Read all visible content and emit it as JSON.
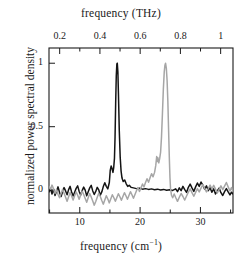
{
  "chart_data": {
    "type": "line",
    "title": "",
    "xlabel": "frequency (cm−1)",
    "xlabel_top": "frequency (THz)",
    "ylabel": "normalized power spectral density",
    "xlim": [
      4.9,
      35.4
    ],
    "ylim": [
      -0.18,
      1.12
    ],
    "xlim_top": [
      0.1469,
      1.0614
    ],
    "grid": false,
    "legend": false,
    "axes": {
      "bottom": {
        "label": "frequency (cm−1)",
        "unit": "cm^-1",
        "major_ticks": [
          10,
          20,
          30
        ],
        "minor_ticks": [
          5,
          15,
          25,
          35
        ],
        "tick_labels": [
          "10",
          "20",
          "30"
        ]
      },
      "top": {
        "label": "frequency (THz)",
        "unit": "THz",
        "major_ticks": [
          0.2,
          0.4,
          0.6,
          0.8,
          1.0
        ],
        "minor_ticks": [
          0.3,
          0.5,
          0.7,
          0.9
        ],
        "tick_labels": [
          "0.2",
          "0.4",
          "0.6",
          "0.8",
          "1"
        ]
      },
      "left": {
        "label": "normalized power spectral density",
        "major_ticks": [
          0,
          0.5,
          1
        ],
        "tick_labels": [
          "0",
          "0.5",
          "1"
        ]
      }
    },
    "series": [
      {
        "name": "black-trace",
        "color": "#141414",
        "peak_x": 16.2,
        "peak_y": 1.0,
        "points": [
          [
            4.9,
            -0.015
          ],
          [
            5.15,
            0.012
          ],
          [
            5.4,
            -0.03
          ],
          [
            5.65,
            0.008
          ],
          [
            5.9,
            -0.042
          ],
          [
            6.15,
            -0.008
          ],
          [
            6.4,
            0.026
          ],
          [
            6.65,
            -0.018
          ],
          [
            6.9,
            -0.05
          ],
          [
            7.15,
            -0.012
          ],
          [
            7.4,
            0.02
          ],
          [
            7.65,
            -0.006
          ],
          [
            7.9,
            -0.036
          ],
          [
            8.15,
            0.004
          ],
          [
            8.4,
            0.03
          ],
          [
            8.65,
            -0.014
          ],
          [
            8.9,
            -0.046
          ],
          [
            9.15,
            -0.016
          ],
          [
            9.4,
            0.014
          ],
          [
            9.65,
            0.034
          ],
          [
            9.9,
            -0.01
          ],
          [
            10.15,
            -0.038
          ],
          [
            10.4,
            -0.004
          ],
          [
            10.65,
            0.024
          ],
          [
            10.9,
            0.0
          ],
          [
            11.15,
            -0.044
          ],
          [
            11.4,
            -0.012
          ],
          [
            11.65,
            0.018
          ],
          [
            11.9,
            0.038
          ],
          [
            12.15,
            -0.006
          ],
          [
            12.4,
            -0.034
          ],
          [
            12.65,
            -0.01
          ],
          [
            12.9,
            0.022
          ],
          [
            13.15,
            0.002
          ],
          [
            13.4,
            -0.04
          ],
          [
            13.65,
            -0.014
          ],
          [
            13.9,
            0.028
          ],
          [
            14.15,
            0.058
          ],
          [
            14.4,
            0.03
          ],
          [
            14.65,
            0.01
          ],
          [
            14.9,
            0.06
          ],
          [
            15.05,
            0.155
          ],
          [
            15.2,
            0.19
          ],
          [
            15.35,
            0.17
          ],
          [
            15.5,
            0.14
          ],
          [
            15.62,
            0.175
          ],
          [
            15.75,
            0.25
          ],
          [
            15.85,
            0.42
          ],
          [
            15.95,
            0.68
          ],
          [
            16.05,
            0.9
          ],
          [
            16.15,
            0.995
          ],
          [
            16.22,
            1.0
          ],
          [
            16.32,
            0.93
          ],
          [
            16.42,
            0.74
          ],
          [
            16.55,
            0.47
          ],
          [
            16.7,
            0.26
          ],
          [
            16.85,
            0.15
          ],
          [
            17.0,
            0.095
          ],
          [
            17.2,
            0.068
          ],
          [
            17.45,
            0.08
          ],
          [
            17.7,
            0.05
          ],
          [
            17.95,
            0.03
          ],
          [
            18.2,
            0.038
          ],
          [
            18.5,
            0.022
          ],
          [
            18.9,
            0.018
          ],
          [
            19.4,
            0.012
          ],
          [
            19.9,
            0.016
          ],
          [
            20.4,
            0.008
          ],
          [
            20.9,
            0.012
          ],
          [
            21.4,
            0.006
          ],
          [
            21.9,
            0.01
          ],
          [
            22.4,
            0.004
          ],
          [
            22.9,
            0.008
          ],
          [
            23.4,
            0.002
          ],
          [
            23.9,
            0.006
          ],
          [
            24.4,
            0.0
          ],
          [
            24.9,
            0.004
          ],
          [
            25.4,
            -0.002
          ],
          [
            25.9,
            0.01
          ],
          [
            26.2,
            -0.012
          ],
          [
            26.5,
            0.018
          ],
          [
            26.8,
            -0.004
          ],
          [
            27.1,
            0.03
          ],
          [
            27.4,
            0.004
          ],
          [
            27.7,
            -0.018
          ],
          [
            28.0,
            0.022
          ],
          [
            28.3,
            0.048
          ],
          [
            28.6,
            0.018
          ],
          [
            28.9,
            -0.01
          ],
          [
            29.2,
            0.026
          ],
          [
            29.5,
            0.056
          ],
          [
            29.8,
            0.03
          ],
          [
            30.1,
            0.064
          ],
          [
            30.4,
            0.04
          ],
          [
            30.7,
            0.008
          ],
          [
            31.0,
            0.034
          ],
          [
            31.3,
            -0.004
          ],
          [
            31.6,
            0.02
          ],
          [
            31.9,
            -0.016
          ],
          [
            32.2,
            0.01
          ],
          [
            32.5,
            -0.03
          ],
          [
            32.8,
            -0.006
          ],
          [
            33.1,
            0.016
          ],
          [
            33.4,
            -0.02
          ],
          [
            33.7,
            -0.042
          ],
          [
            34.0,
            -0.012
          ],
          [
            34.3,
            0.012
          ],
          [
            34.6,
            -0.014
          ],
          [
            34.9,
            -0.038
          ],
          [
            35.15,
            -0.016
          ],
          [
            35.4,
            -0.03
          ]
        ]
      },
      {
        "name": "gray-trace",
        "color": "#a6a6a6",
        "peak_x": 24.3,
        "peak_y": 1.0,
        "points": [
          [
            4.9,
            0.03
          ],
          [
            5.15,
            0.008
          ],
          [
            5.4,
            0.04
          ],
          [
            5.65,
            0.01
          ],
          [
            5.9,
            -0.026
          ],
          [
            6.15,
            0.004
          ],
          [
            6.4,
            -0.034
          ],
          [
            6.65,
            -0.06
          ],
          [
            6.9,
            -0.028
          ],
          [
            7.15,
            0.006
          ],
          [
            7.4,
            -0.024
          ],
          [
            7.65,
            -0.056
          ],
          [
            7.9,
            -0.088
          ],
          [
            8.15,
            -0.052
          ],
          [
            8.4,
            -0.018
          ],
          [
            8.65,
            -0.046
          ],
          [
            8.9,
            -0.078
          ],
          [
            9.15,
            -0.044
          ],
          [
            9.4,
            -0.014
          ],
          [
            9.65,
            -0.04
          ],
          [
            9.9,
            -0.072
          ],
          [
            10.15,
            -0.038
          ],
          [
            10.4,
            -0.008
          ],
          [
            10.65,
            -0.034
          ],
          [
            10.9,
            -0.066
          ],
          [
            11.15,
            -0.096
          ],
          [
            11.4,
            -0.06
          ],
          [
            11.65,
            -0.026
          ],
          [
            11.9,
            -0.054
          ],
          [
            12.15,
            -0.086
          ],
          [
            12.4,
            -0.118
          ],
          [
            12.65,
            -0.09
          ],
          [
            12.9,
            -0.056
          ],
          [
            13.15,
            -0.024
          ],
          [
            13.4,
            -0.05
          ],
          [
            13.65,
            -0.082
          ],
          [
            13.9,
            -0.11
          ],
          [
            14.15,
            -0.078
          ],
          [
            14.4,
            -0.044
          ],
          [
            14.65,
            -0.07
          ],
          [
            14.9,
            -0.1
          ],
          [
            15.15,
            -0.068
          ],
          [
            15.4,
            -0.036
          ],
          [
            15.65,
            -0.06
          ],
          [
            15.9,
            -0.088
          ],
          [
            16.15,
            -0.058
          ],
          [
            16.4,
            -0.028
          ],
          [
            16.65,
            -0.052
          ],
          [
            16.9,
            -0.08
          ],
          [
            17.15,
            -0.05
          ],
          [
            17.4,
            -0.02
          ],
          [
            17.65,
            -0.044
          ],
          [
            17.9,
            -0.072
          ],
          [
            18.15,
            -0.042
          ],
          [
            18.4,
            -0.012
          ],
          [
            18.65,
            -0.036
          ],
          [
            18.9,
            -0.064
          ],
          [
            19.15,
            -0.034
          ],
          [
            19.4,
            -0.004
          ],
          [
            19.65,
            0.02
          ],
          [
            19.9,
            -0.01
          ],
          [
            20.15,
            0.018
          ],
          [
            20.4,
            0.048
          ],
          [
            20.65,
            0.026
          ],
          [
            20.9,
            0.06
          ],
          [
            21.15,
            0.09
          ],
          [
            21.4,
            0.062
          ],
          [
            21.65,
            0.098
          ],
          [
            21.9,
            0.13
          ],
          [
            22.15,
            0.105
          ],
          [
            22.4,
            0.14
          ],
          [
            22.6,
            0.195
          ],
          [
            22.75,
            0.265
          ],
          [
            22.85,
            0.225
          ],
          [
            22.95,
            0.255
          ],
          [
            23.1,
            0.215
          ],
          [
            23.25,
            0.25
          ],
          [
            23.4,
            0.3
          ],
          [
            23.55,
            0.42
          ],
          [
            23.7,
            0.6
          ],
          [
            23.85,
            0.79
          ],
          [
            24.0,
            0.93
          ],
          [
            24.12,
            0.985
          ],
          [
            24.22,
            1.0
          ],
          [
            24.35,
            0.96
          ],
          [
            24.48,
            0.86
          ],
          [
            24.6,
            0.7
          ],
          [
            24.72,
            0.48
          ],
          [
            24.85,
            0.25
          ],
          [
            24.95,
            0.1
          ],
          [
            25.05,
            0.01
          ],
          [
            25.2,
            -0.04
          ],
          [
            25.4,
            -0.06
          ],
          [
            25.65,
            -0.03
          ],
          [
            25.9,
            -0.058
          ],
          [
            26.2,
            -0.088
          ],
          [
            26.5,
            -0.056
          ],
          [
            26.8,
            -0.026
          ],
          [
            27.1,
            -0.05
          ],
          [
            27.4,
            -0.078
          ],
          [
            27.7,
            -0.046
          ],
          [
            28.0,
            -0.016
          ],
          [
            28.3,
            0.01
          ],
          [
            28.6,
            -0.02
          ],
          [
            28.9,
            -0.048
          ],
          [
            29.2,
            -0.018
          ],
          [
            29.5,
            0.012
          ],
          [
            29.8,
            -0.014
          ],
          [
            30.1,
            0.016
          ],
          [
            30.4,
            0.044
          ],
          [
            30.7,
            0.014
          ],
          [
            31.0,
            -0.014
          ],
          [
            31.3,
            0.012
          ],
          [
            31.6,
            0.04
          ],
          [
            31.9,
            0.01
          ],
          [
            32.2,
            0.038
          ],
          [
            32.5,
            0.008
          ],
          [
            32.8,
            -0.022
          ],
          [
            33.1,
            0.006
          ],
          [
            33.4,
            0.034
          ],
          [
            33.7,
            0.004
          ],
          [
            34.0,
            0.032
          ],
          [
            34.3,
            0.06
          ],
          [
            34.6,
            0.026
          ],
          [
            34.9,
            -0.006
          ],
          [
            35.15,
            0.02
          ],
          [
            35.4,
            -0.01
          ]
        ]
      }
    ]
  }
}
